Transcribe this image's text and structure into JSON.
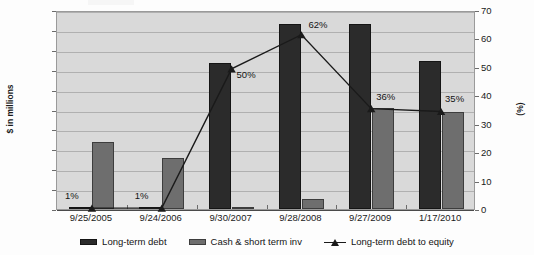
{
  "chart_data": {
    "type": "bar",
    "title": "",
    "categories": [
      "9/25/2005",
      "9/24/2006",
      "9/30/2007",
      "9/28/2008",
      "9/27/2009",
      "1/17/2010"
    ],
    "xlabel": "",
    "ylabel": "$ in millions",
    "ylabel_secondary": "(%)",
    "ylim": [
      0,
      1000
    ],
    "ylim_secondary": [
      0,
      70
    ],
    "yticks": [
      "0",
      "100",
      "200",
      "300",
      "400",
      "500",
      "600",
      "700",
      "800",
      "900",
      "1,000"
    ],
    "yticks_secondary": [
      "0",
      "10",
      "20",
      "30",
      "40",
      "50",
      "60",
      "70"
    ],
    "grid": true,
    "legend_position": "bottom",
    "series": [
      {
        "name": "Long-term debt",
        "type": "bar",
        "axis": "left",
        "color": "#2b2b2b",
        "values": [
          10,
          12,
          735,
          930,
          930,
          745
        ]
      },
      {
        "name": "Cash & short term inv",
        "type": "bar",
        "axis": "left",
        "color": "#6e6e6e",
        "values": [
          335,
          255,
          8,
          50,
          510,
          490
        ]
      },
      {
        "name": "Long-term debt to equity",
        "type": "line",
        "axis": "right",
        "color": "#1a1a1a",
        "marker": "triangle",
        "values": [
          1,
          1,
          50,
          62,
          36,
          35
        ],
        "point_labels": [
          "1%",
          "1%",
          "50%",
          "62%",
          "36%",
          "35%"
        ]
      }
    ]
  },
  "axes": {
    "left_title": "$ in millions",
    "right_title": "(%)"
  },
  "legend": {
    "items": [
      {
        "label": "Long-term debt",
        "marker": "bar-dark"
      },
      {
        "label": "Cash & short term inv",
        "marker": "bar-gray"
      },
      {
        "label": "Long-term debt to equity",
        "marker": "line-triangle"
      }
    ]
  }
}
